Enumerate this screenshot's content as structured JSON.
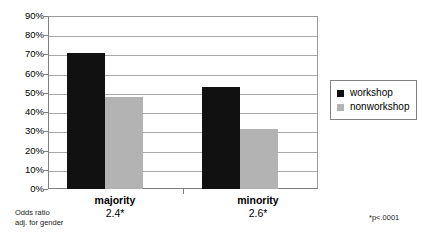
{
  "chart_data": {
    "type": "bar",
    "title": "",
    "xlabel": "",
    "ylabel": "",
    "categories": [
      "majority",
      "minority"
    ],
    "category_sublabels": [
      "2.4*",
      "2.6*"
    ],
    "series": [
      {
        "name": "workshop",
        "color": "#111111",
        "values": [
          71,
          53
        ]
      },
      {
        "name": "nonworkshop",
        "color": "#b3b3b3",
        "values": [
          48,
          31
        ]
      }
    ],
    "ylim": [
      0,
      90
    ],
    "ytick_values": [
      0,
      10,
      20,
      30,
      40,
      50,
      60,
      70,
      80,
      90
    ],
    "ytick_labels": [
      "0%",
      "10%",
      "20%",
      "30%",
      "40%",
      "50%",
      "60%",
      "70%",
      "80%",
      "90%"
    ],
    "grid": true,
    "legend_position": "right",
    "annotations": {
      "odds_ratio_line1": "Odds ratio",
      "odds_ratio_line2": "adj. for gender",
      "significance": "*p<.0001"
    }
  },
  "legend": {
    "items": [
      {
        "label": "workshop",
        "swatch": "workshop-swatch"
      },
      {
        "label": "nonworkshop",
        "swatch": "nonworkshop-swatch"
      }
    ]
  }
}
